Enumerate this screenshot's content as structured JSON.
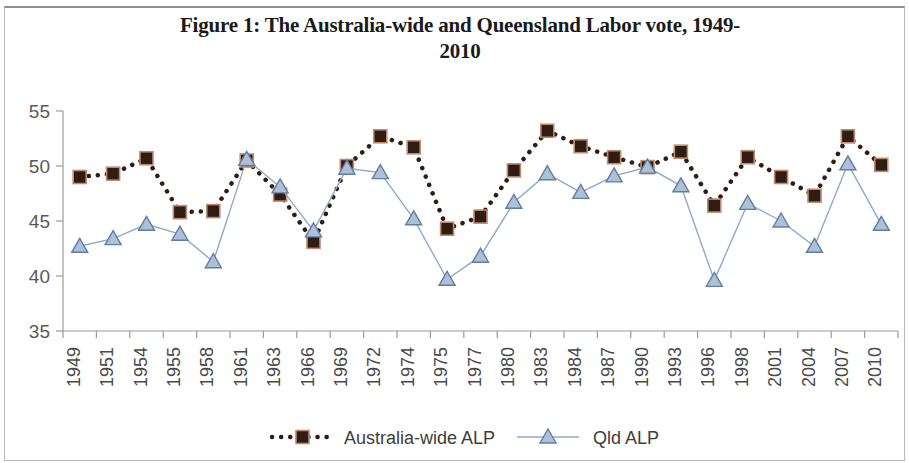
{
  "figure": {
    "title_line1": "Figure 1:   The Australia-wide and Queensland Labor vote, 1949-",
    "title_line2": "2010"
  },
  "legend": {
    "series1_label": "Australia-wide ALP",
    "series2_label": "Qld ALP",
    "series1_marker": "square-marker-icon",
    "series2_marker": "triangle-marker-icon"
  },
  "chart_data": {
    "type": "line",
    "xlabel": "",
    "ylabel": "",
    "ylim": [
      35,
      55
    ],
    "yticks": [
      35,
      40,
      45,
      50,
      55
    ],
    "grid": false,
    "legend_position": "bottom",
    "categories": [
      "1949",
      "1951",
      "1954",
      "1955",
      "1958",
      "1961",
      "1963",
      "1966",
      "1969",
      "1972",
      "1974",
      "1975",
      "1977",
      "1980",
      "1983",
      "1984",
      "1987",
      "1990",
      "1993",
      "1996",
      "1998",
      "2001",
      "2004",
      "2007",
      "2010"
    ],
    "series": [
      {
        "name": "Australia-wide ALP",
        "color": "#2f1c15",
        "line_style": "dotted",
        "marker": "square",
        "values": [
          49.0,
          49.3,
          50.7,
          45.8,
          45.9,
          50.5,
          47.4,
          43.1,
          50.0,
          52.7,
          51.7,
          44.3,
          45.4,
          49.6,
          53.2,
          51.8,
          50.8,
          49.9,
          51.3,
          46.4,
          50.8,
          49.0,
          47.3,
          52.7,
          50.1
        ]
      },
      {
        "name": "Qld ALP",
        "color": "#8faac9",
        "line_style": "solid",
        "marker": "triangle",
        "values": [
          42.7,
          43.4,
          44.7,
          43.8,
          41.3,
          50.6,
          48.1,
          44.1,
          49.8,
          49.4,
          45.2,
          39.7,
          41.8,
          46.7,
          49.3,
          47.6,
          49.1,
          49.9,
          48.2,
          39.6,
          46.6,
          45.0,
          42.7,
          50.2,
          44.7
        ]
      }
    ]
  },
  "colors": {
    "series1": "#2f1c15",
    "series1_marker_edge": "#c08a6e",
    "series2": "#8faac9",
    "series2_marker_fill": "#aebfd6",
    "series2_marker_edge": "#5f7fa6",
    "axis": "#9a9a9a",
    "tick_text": "#5a5a5a",
    "page_border": "#b9b9b9"
  }
}
